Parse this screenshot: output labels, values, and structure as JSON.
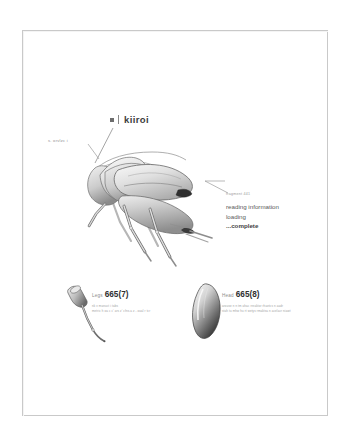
{
  "page": {
    "background_color": "#ffffff",
    "sheet_border_color": "#c9c9c9"
  },
  "title": {
    "bullet": "square-bullet",
    "label": "kiiroi"
  },
  "annotations": {
    "left_tag": "s. orvlzc i",
    "callout": {
      "kicker": "fragment 441",
      "lines": [
        "reading information",
        "loading",
        "...complete"
      ]
    }
  },
  "specimens": [
    {
      "id": "legs",
      "part_label": "Legs",
      "code": "665(7)",
      "detail_lines": [
        "nk v manuct i            tabs",
        "metric h oa c c' ars  z' cfns.a z - oual r tcr"
      ]
    },
    {
      "id": "head",
      "part_label": "Head",
      "code": "665(8)",
      "detail_lines": [
        "arouse n n tm ahac rreaktor rhaetcs n aadr",
        "stah tu mhw hu rt wetys rmaktsa n acelacr niawt"
      ]
    }
  ],
  "illustration": {
    "name": "insect-lateral-view",
    "palette": {
      "body_light": "#f1f1f1",
      "body_mid": "#c8c8c8",
      "body_dark": "#7d7d7d",
      "outline": "#6b6b6b",
      "accent_dark": "#2b2b2b"
    }
  }
}
